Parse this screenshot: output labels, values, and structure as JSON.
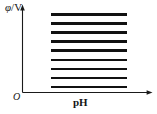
{
  "chart_data": {
    "type": "line",
    "title": "",
    "xlabel": "pH",
    "ylabel": "φ/V",
    "ylabel_quantity": "φ",
    "ylabel_unit": "/V",
    "origin_label": "O",
    "grid": false,
    "legend": "none",
    "axis_tick_labels": {
      "x": [],
      "y": []
    },
    "xlim": [
      0,
      1
    ],
    "ylim": [
      0,
      1
    ],
    "x_start": 0.22,
    "x_end": 0.8,
    "series": [
      {
        "name": "line-1",
        "y": 0.905,
        "x": [
          0.22,
          0.8
        ]
      },
      {
        "name": "line-2",
        "y": 0.8,
        "x": [
          0.22,
          0.8
        ]
      },
      {
        "name": "line-3",
        "y": 0.695,
        "x": [
          0.22,
          0.8
        ]
      },
      {
        "name": "line-4",
        "y": 0.59,
        "x": [
          0.22,
          0.8
        ]
      },
      {
        "name": "line-5",
        "y": 0.485,
        "x": [
          0.22,
          0.8
        ]
      },
      {
        "name": "line-6",
        "y": 0.38,
        "x": [
          0.22,
          0.8
        ]
      },
      {
        "name": "line-7",
        "y": 0.275,
        "x": [
          0.22,
          0.8
        ]
      },
      {
        "name": "line-8",
        "y": 0.17,
        "x": [
          0.22,
          0.8
        ]
      },
      {
        "name": "line-9",
        "y": 0.065,
        "x": [
          0.22,
          0.8
        ]
      }
    ],
    "colors": {
      "axis": "#1a1a1a",
      "line": "#111111",
      "background": "#ffffff",
      "text": "#141414"
    }
  }
}
